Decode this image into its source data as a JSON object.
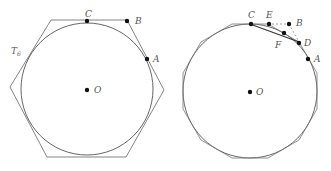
{
  "figures": [
    {
      "name": "circumscribed-hexagon",
      "polygon_label": "T",
      "polygon_label_sub": "6",
      "points": {
        "A": "A",
        "B": "B",
        "C": "C",
        "O": "O"
      }
    },
    {
      "name": "circumscribed-dodecagon",
      "points": {
        "A": "A",
        "B": "B",
        "C": "C",
        "D": "D",
        "E": "E",
        "F": "F",
        "O": "O"
      }
    }
  ],
  "colors": {
    "stroke": "#555555",
    "point": "#111111"
  }
}
